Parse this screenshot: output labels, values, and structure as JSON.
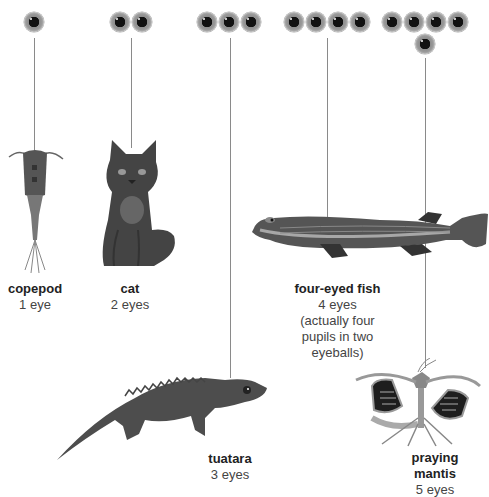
{
  "animals": [
    {
      "name": "copepod",
      "eyes_label": "1 eye",
      "eye_count": 1
    },
    {
      "name": "cat",
      "eyes_label": "2 eyes",
      "eye_count": 2
    },
    {
      "name": "tuatara",
      "eyes_label": "3 eyes",
      "eye_count": 3
    },
    {
      "name": "four-eyed fish",
      "eyes_label": "4 eyes",
      "note_lines": [
        "(actually four",
        "pupils in two",
        "eyeballs)"
      ],
      "eye_count": 4
    },
    {
      "name_lines": [
        "praying",
        "mantis"
      ],
      "name": "praying mantis",
      "eyes_label": "5 eyes",
      "eye_count": 5
    }
  ],
  "icons": {
    "eye": "eye-icon"
  },
  "colors": {
    "line": "#8a8a8a",
    "iris": "#9a9a9a",
    "pupil": "#111111",
    "text": "#333333"
  }
}
